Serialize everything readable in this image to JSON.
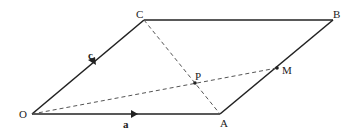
{
  "diagram": {
    "type": "parallelogram-vectors",
    "points": {
      "O": {
        "label": "O",
        "x": 32,
        "y": 114
      },
      "A": {
        "label": "A",
        "x": 220,
        "y": 114
      },
      "B": {
        "label": "B",
        "x": 333,
        "y": 20
      },
      "C": {
        "label": "C",
        "x": 144,
        "y": 20
      },
      "M": {
        "label": "M",
        "x": 277,
        "y": 68
      },
      "P": {
        "label": "P",
        "x": 195,
        "y": 83
      }
    },
    "vectors": [
      {
        "from": "O",
        "to": "A",
        "label": "a"
      },
      {
        "from": "O",
        "to": "C",
        "label": "c"
      }
    ],
    "solid_edges": [
      "OA",
      "AB",
      "BC",
      "CO"
    ],
    "dashed_lines": [
      "OM",
      "CA"
    ],
    "colors": {
      "line": "#222222",
      "dashed": "#555555"
    }
  }
}
